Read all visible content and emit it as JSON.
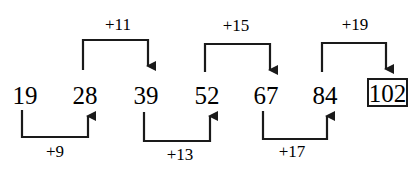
{
  "sequence": {
    "terms": [
      "19",
      "28",
      "39",
      "52",
      "67",
      "84",
      "102"
    ],
    "answer": "102",
    "differences": [
      "+9",
      "+11",
      "+13",
      "+15",
      "+17",
      "+19"
    ]
  },
  "colors": {
    "ink": "#1a1a1a",
    "background": "#ffffff"
  }
}
